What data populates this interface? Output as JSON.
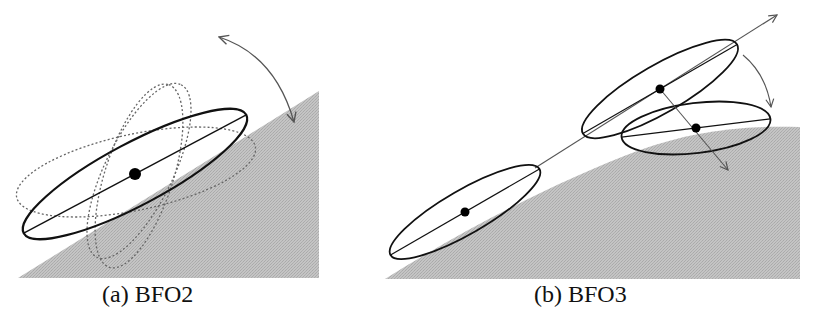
{
  "figure": {
    "colors": {
      "background": "#ffffff",
      "shade": "#bcbcbc",
      "stroke": "#111111",
      "arrow": "#555555",
      "dotted": "#666666"
    },
    "panels": [
      {
        "id": "a",
        "caption": "(a) BFO2",
        "description": "Ellipse rotating about its center over a shaded region; dotted ellipses show alternative orientations",
        "region": {
          "type": "polygon",
          "points": [
            [
              18,
              278
            ],
            [
              319,
              91
            ],
            [
              319,
              278
            ]
          ]
        },
        "main_ellipse": {
          "cx": 135,
          "cy": 174,
          "rx": 125,
          "ry": 30,
          "angle": -28
        },
        "dotted_ellipses": [
          {
            "cx": 135,
            "cy": 174,
            "rx": 122,
            "ry": 38,
            "angle": -12
          },
          {
            "cx": 135,
            "cy": 174,
            "rx": 130,
            "ry": 32,
            "angle": -62
          },
          {
            "cx": 135,
            "cy": 174,
            "rx": 128,
            "ry": 30,
            "angle": -70
          }
        ],
        "rotation_arrow": {
          "from": [
            219,
            37
          ],
          "to": [
            295,
            124
          ],
          "double_headed": true
        }
      },
      {
        "id": "b",
        "caption": "(b) BFO3",
        "description": "Ellipse translating along a line then rotating onto a curved shaded region",
        "region": {
          "type": "curve",
          "points": [
            [
              385,
              279
            ],
            [
              470,
              230
            ],
            [
              560,
              188
            ],
            [
              640,
              150
            ],
            [
              720,
              128
            ],
            [
              800,
              127
            ],
            [
              800,
              279
            ]
          ]
        },
        "ellipses": [
          {
            "cx": 465,
            "cy": 212,
            "rx": 85,
            "ry": 22,
            "angle": -30
          },
          {
            "cx": 660,
            "cy": 89,
            "rx": 88,
            "ry": 24,
            "angle": -30
          },
          {
            "cx": 696,
            "cy": 128,
            "rx": 75,
            "ry": 25,
            "angle": -7
          }
        ],
        "translation_arrow": {
          "from": [
            535,
            168
          ],
          "to": [
            777,
            15
          ]
        },
        "normal_arrow": {
          "from": [
            660,
            89
          ],
          "to": [
            728,
            170
          ]
        },
        "rotation_arrow": {
          "from": [
            743,
            55
          ],
          "to": [
            771,
            107
          ]
        }
      }
    ]
  }
}
